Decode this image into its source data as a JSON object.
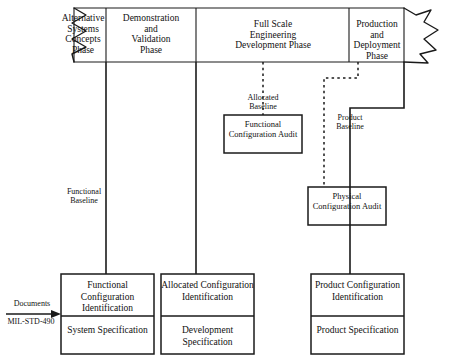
{
  "diagram": {
    "colors": {
      "line": "#1a1a1a",
      "text": "#111111",
      "background": "#ffffff"
    }
  },
  "banner": {
    "name": "acquisition-phase-banner",
    "phases": [
      {
        "id": "alternative-systems-concepts-phase",
        "lines": [
          "Alternative",
          "Systems",
          "Concepts",
          "Phase"
        ]
      },
      {
        "id": "demonstration-and-validation-phase",
        "lines": [
          "Demonstration",
          "and",
          "Validation",
          "Phase"
        ]
      },
      {
        "id": "full-scale-engineering-development-phase",
        "lines": [
          "Full Scale",
          "Engineering",
          "Development Phase"
        ]
      },
      {
        "id": "production-and-deployment-phase",
        "lines": [
          "Production",
          "and",
          "Deployment Phase"
        ]
      }
    ]
  },
  "baselines": [
    {
      "id": "allocated-baseline",
      "lines": [
        "Allocated",
        "Baseline"
      ]
    },
    {
      "id": "product-baseline",
      "lines": [
        "Product",
        "Baseline"
      ]
    },
    {
      "id": "functional-baseline",
      "lines": [
        "Functional",
        "Baseline"
      ]
    }
  ],
  "audits": [
    {
      "id": "functional-configuration-audit",
      "lines": [
        "Functional",
        "Configuration",
        "Audit"
      ]
    },
    {
      "id": "physical-configuration-audit",
      "lines": [
        "Physical",
        "Configuration",
        "Audit"
      ]
    }
  ],
  "documents_arrow": {
    "above_label": "Documents",
    "below_label": "MIL-STD-490"
  },
  "identification_boxes": [
    {
      "id": "functional-configuration-identification",
      "top_lines": [
        "Functional",
        "Configuration",
        "Identification"
      ],
      "bottom_lines": [
        "System",
        "Specification"
      ]
    },
    {
      "id": "allocated-configuration-identification",
      "top_lines": [
        "Allocated",
        "Configuration",
        "Identification"
      ],
      "bottom_lines": [
        "Development",
        "Specification"
      ]
    },
    {
      "id": "product-configuration-identification",
      "top_lines": [
        "Product",
        "Configuration",
        "Identification"
      ],
      "bottom_lines": [
        "Product",
        "Specification"
      ]
    }
  ]
}
